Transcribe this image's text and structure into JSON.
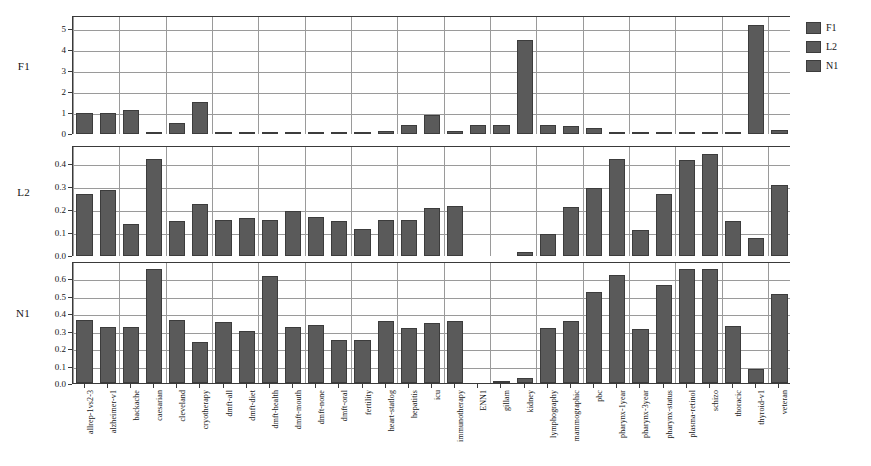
{
  "figure": {
    "background": "#ffffff",
    "bar_color": "#5a5a5a",
    "bar_edge_color": "#3c3c3c",
    "grid_color": "#9a9a9a",
    "axis_color": "#3a3a3a"
  },
  "legend": {
    "position": "right",
    "entries": [
      {
        "label": "F1",
        "color": "#5a5a5a"
      },
      {
        "label": "L2",
        "color": "#5a5a5a"
      },
      {
        "label": "N1",
        "color": "#5a5a5a"
      }
    ]
  },
  "chart_data": {
    "type": "bar",
    "title": "",
    "xlabel": "",
    "ylabel": "",
    "grid": true,
    "layout": "3 stacked panels sharing one categorical x-axis",
    "categories": [
      "allrep-1vs2-3",
      "alzheimer-v1",
      "backache",
      "caesarian",
      "cleveland",
      "cryotherapy",
      "dmft-all",
      "dmft-diet",
      "dmft-health",
      "dmft-mouth",
      "dmft-none",
      "dmft-oral",
      "fertility",
      "heart-statlog",
      "hepatitis",
      "icu",
      "immunotherapy",
      "ENN1",
      "gillam",
      "kidney",
      "lymphography",
      "mammographic",
      "pbc",
      "pharynx-1year",
      "pharynx-3year",
      "pharynx-status",
      "plasma-retinol",
      "schizo",
      "thoracic",
      "thyroid-v1",
      "veteran"
    ],
    "panels": [
      {
        "name": "F1",
        "ylabel": "F1",
        "ylim": [
          0,
          5.6
        ],
        "yticks": [
          0,
          1,
          2,
          3,
          4,
          5
        ],
        "ytick_labels": [
          "0",
          "1",
          "2",
          "3",
          "4",
          "5"
        ],
        "values": [
          1.0,
          1.0,
          1.12,
          0.05,
          0.5,
          1.52,
          0.05,
          0.01,
          0.01,
          0.01,
          0.01,
          0.01,
          0.05,
          0.14,
          0.44,
          0.9,
          0.15,
          0.42,
          0.42,
          4.48,
          0.42,
          0.36,
          0.28,
          0.02,
          0.02,
          0.02,
          0.04,
          0.03,
          0.04,
          5.18,
          0.18
        ]
      },
      {
        "name": "L2",
        "ylabel": "L2",
        "ylim": [
          0,
          0.48
        ],
        "yticks": [
          0.0,
          0.1,
          0.2,
          0.3,
          0.4
        ],
        "ytick_labels": [
          "0.0",
          "0.1",
          "0.2",
          "0.3",
          "0.4"
        ],
        "values": [
          0.272,
          0.287,
          0.139,
          0.425,
          0.153,
          0.228,
          0.158,
          0.165,
          0.155,
          0.197,
          0.169,
          0.151,
          0.117,
          0.155,
          0.157,
          0.21,
          0.218,
          0.0,
          0.0,
          0.016,
          0.098,
          0.213,
          0.297,
          0.425,
          0.115,
          0.272,
          0.42,
          0.445,
          0.152,
          0.079,
          0.312
        ]
      },
      {
        "name": "N1",
        "ylabel": "N1",
        "ylim": [
          0,
          0.7
        ],
        "yticks": [
          0.0,
          0.1,
          0.2,
          0.3,
          0.4,
          0.5,
          0.6
        ],
        "ytick_labels": [
          "0.0",
          "0.1",
          "0.2",
          "0.3",
          "0.4",
          "0.5",
          "0.6"
        ],
        "values": [
          0.363,
          0.323,
          0.321,
          0.657,
          0.363,
          0.233,
          0.348,
          0.296,
          0.616,
          0.324,
          0.331,
          0.246,
          0.245,
          0.354,
          0.315,
          0.343,
          0.357,
          0.0,
          0.008,
          0.027,
          0.318,
          0.358,
          0.523,
          0.62,
          0.31,
          0.56,
          0.652,
          0.652,
          0.33,
          0.082,
          0.513
        ]
      }
    ]
  }
}
